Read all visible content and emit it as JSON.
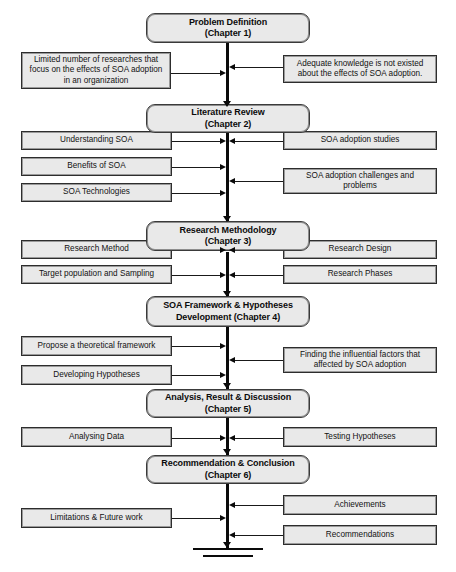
{
  "diagram": {
    "colors": {
      "node_fill": "#e9e9e9",
      "node_border": "#2d2d2d",
      "line": "#0a0a0a",
      "background": "#ffffff"
    },
    "chapters": [
      {
        "id": "ch1",
        "line1": "Problem Definition",
        "line2": "(Chapter 1)"
      },
      {
        "id": "ch2",
        "line1": "Literature Review",
        "line2": "(Chapter 2)"
      },
      {
        "id": "ch3",
        "line1": "Research Methodology",
        "line2": "(Chapter 3)"
      },
      {
        "id": "ch4",
        "line1": "SOA Framework & Hypotheses",
        "line2": "Development (Chapter 4)"
      },
      {
        "id": "ch5",
        "line1": "Analysis, Result & Discussion",
        "line2": "(Chapter 5)"
      },
      {
        "id": "ch6",
        "line1": "Recommendation & Conclusion",
        "line2": "(Chapter 6)"
      }
    ],
    "left_nodes": [
      {
        "id": "l1",
        "line1": "Limited number of researches that",
        "line2": "focus on the effects of SOA adoption",
        "line3": "in an organization"
      },
      {
        "id": "l2",
        "line1": "Understanding SOA",
        "line2": "",
        "line3": ""
      },
      {
        "id": "l3",
        "line1": "Benefits of SOA",
        "line2": "",
        "line3": ""
      },
      {
        "id": "l4",
        "line1": "SOA Technologies",
        "line2": "",
        "line3": ""
      },
      {
        "id": "l5",
        "line1": "Research Method",
        "line2": "",
        "line3": ""
      },
      {
        "id": "l6",
        "line1": "Target population and Sampling",
        "line2": "",
        "line3": ""
      },
      {
        "id": "l7",
        "line1": "Propose a theoretical framework",
        "line2": "",
        "line3": ""
      },
      {
        "id": "l8",
        "line1": "Developing Hypotheses",
        "line2": "",
        "line3": ""
      },
      {
        "id": "l9",
        "line1": "Analysing Data",
        "line2": "",
        "line3": ""
      },
      {
        "id": "l10",
        "line1": "Limitations & Future work",
        "line2": "",
        "line3": ""
      }
    ],
    "right_nodes": [
      {
        "id": "r1",
        "line1": "Adequate knowledge is not existed",
        "line2": "about the effects of SOA adoption.",
        "line3": ""
      },
      {
        "id": "r2",
        "line1": "SOA adoption studies",
        "line2": "",
        "line3": ""
      },
      {
        "id": "r3",
        "line1": "SOA adoption challenges and",
        "line2": "problems",
        "line3": ""
      },
      {
        "id": "r4",
        "line1": "Research Design",
        "line2": "",
        "line3": ""
      },
      {
        "id": "r5",
        "line1": "Research Phases",
        "line2": "",
        "line3": ""
      },
      {
        "id": "r6",
        "line1": "Finding the influential factors that",
        "line2": "affected  by SOA adoption",
        "line3": ""
      },
      {
        "id": "r7",
        "line1": "Testing Hypotheses",
        "line2": "",
        "line3": ""
      },
      {
        "id": "r8",
        "line1": "Achievements",
        "line2": "",
        "line3": ""
      },
      {
        "id": "r9",
        "line1": "Recommendations",
        "line2": "",
        "line3": ""
      }
    ]
  }
}
